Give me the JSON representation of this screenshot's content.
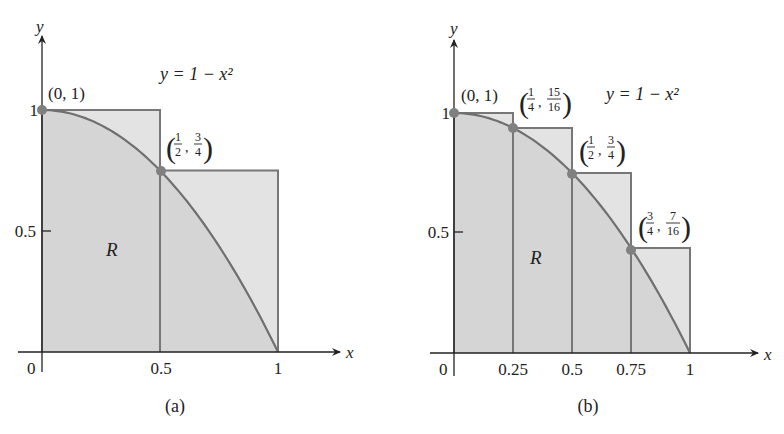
{
  "figure": {
    "function_label": "y = 1 − x²",
    "function_expr": "1 - x^2",
    "region_label": "R",
    "colors": {
      "background": "#ffffff",
      "rect_fill": "#e3e3e3",
      "region_fill": "#d2d2d2",
      "rect_stroke": "#777777",
      "curve": "#6f6f6f",
      "point": "#808080",
      "axis": "#222222",
      "text": "#222222"
    }
  },
  "panels": [
    {
      "id": "a",
      "caption": "(a)",
      "axis_x_label": "x",
      "axis_y_label": "y",
      "origin_label": "0",
      "x_ticks": [
        {
          "v": 0.5,
          "label": "0.5"
        },
        {
          "v": 1,
          "label": "1"
        }
      ],
      "y_ticks": [
        {
          "v": 0.5,
          "label": "0.5"
        },
        {
          "v": 1,
          "label": "1"
        }
      ],
      "rectangles": [
        {
          "x0": 0,
          "x1": 0.5,
          "height": 1
        },
        {
          "x0": 0.5,
          "x1": 1,
          "height": 0.75
        }
      ],
      "points": [
        {
          "x": 0,
          "y": 1,
          "label": "(0, 1)",
          "type": "plain"
        },
        {
          "x": 0.5,
          "y": 0.75,
          "label_num_x": "1",
          "label_den_x": "2",
          "label_num_y": "3",
          "label_den_y": "4",
          "type": "fraction"
        }
      ]
    },
    {
      "id": "b",
      "caption": "(b)",
      "axis_x_label": "x",
      "axis_y_label": "y",
      "origin_label": "0",
      "x_ticks": [
        {
          "v": 0.25,
          "label": "0.25"
        },
        {
          "v": 0.5,
          "label": "0.5"
        },
        {
          "v": 0.75,
          "label": "0.75"
        },
        {
          "v": 1,
          "label": "1"
        }
      ],
      "y_ticks": [
        {
          "v": 0.5,
          "label": "0.5"
        },
        {
          "v": 1,
          "label": "1"
        }
      ],
      "rectangles": [
        {
          "x0": 0,
          "x1": 0.25,
          "height": 1
        },
        {
          "x0": 0.25,
          "x1": 0.5,
          "height": 0.9375
        },
        {
          "x0": 0.5,
          "x1": 0.75,
          "height": 0.75
        },
        {
          "x0": 0.75,
          "x1": 1,
          "height": 0.4375
        }
      ],
      "points": [
        {
          "x": 0,
          "y": 1,
          "label": "(0, 1)",
          "type": "plain"
        },
        {
          "x": 0.25,
          "y": 0.9375,
          "label_num_x": "1",
          "label_den_x": "4",
          "label_num_y": "15",
          "label_den_y": "16",
          "type": "fraction"
        },
        {
          "x": 0.5,
          "y": 0.75,
          "label_num_x": "1",
          "label_den_x": "2",
          "label_num_y": "3",
          "label_den_y": "4",
          "type": "fraction"
        },
        {
          "x": 0.75,
          "y": 0.4375,
          "label_num_x": "3",
          "label_den_x": "4",
          "label_num_y": "7",
          "label_den_y": "16",
          "type": "fraction"
        }
      ]
    }
  ]
}
